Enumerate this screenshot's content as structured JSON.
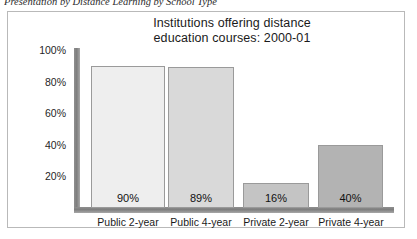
{
  "figure": {
    "caption": "Presentation by Distance Learning by School Type"
  },
  "chart_data": {
    "type": "bar",
    "title": "Institutions offering distance education courses: 2000-01",
    "title_line1": "Institutions offering distance",
    "title_line2": "education courses: 2000-01",
    "xlabel": "",
    "ylabel": "",
    "ylim": [
      0,
      100
    ],
    "grid": false,
    "legend": "none",
    "unit": "%",
    "categories": [
      "Public 2-year",
      "Public 4-year",
      "Private 2-year",
      "Private 4-year"
    ],
    "values": [
      90,
      89,
      16,
      40
    ],
    "data_labels": [
      "90%",
      "89%",
      "16%",
      "40%"
    ],
    "yticks": [
      100,
      80,
      60,
      40,
      20
    ],
    "ytick_labels": [
      "100%",
      "80%",
      "60%",
      "40%",
      "20%"
    ],
    "bar_colors": [
      "#eeeeee",
      "#d9d9d9",
      "#c4c4c4",
      "#b3b3b3"
    ],
    "bar_border_color": "#9a9a9a",
    "axis_color": "#7e7e7e"
  }
}
